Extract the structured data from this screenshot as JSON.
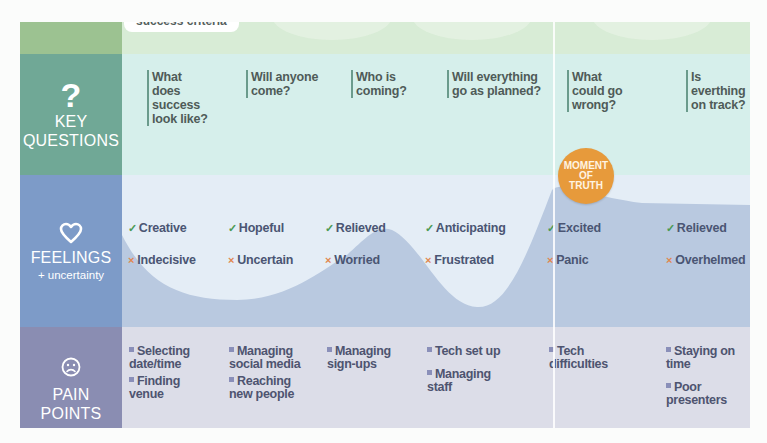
{
  "top_row": {
    "pill_label": "success criteria"
  },
  "key_questions": {
    "icon": "?",
    "label_line1": "KEY",
    "label_line2": "QUESTIONS",
    "questions": [
      "What does success look like?",
      "Will anyone come?",
      "Who is coming?",
      "Will everything go as planned?",
      "What could go wrong?",
      "Is everthing on track?"
    ]
  },
  "moment_of_truth": {
    "line1": "MOMENT",
    "line2": "OF",
    "line3": "TRUTH",
    "color": "#e79a3b"
  },
  "feelings": {
    "icon": "heart-icon",
    "label": "FEELINGS",
    "sublabel": "+ uncertainty",
    "positive_mark": "✓",
    "negative_mark": "×",
    "positive": [
      "Creative",
      "Hopeful",
      "Relieved",
      "Anticipating",
      "Excited",
      "Relieved"
    ],
    "negative": [
      "Indecisive",
      "Uncertain",
      "Worried",
      "Frustrated",
      "Panic",
      "Overhelmed"
    ]
  },
  "pain_points": {
    "icon": "sad-face-icon",
    "label_line1": "PAIN",
    "label_line2": "POINTS",
    "items": [
      [
        "Selecting date/time",
        "Finding venue"
      ],
      [
        "Managing social media",
        "Reaching new people"
      ],
      [
        "Managing sign-ups"
      ],
      [
        "Tech set up",
        "Managing staff"
      ],
      [
        "Tech difficulties"
      ],
      [
        "Staying on time",
        "Poor presenters"
      ]
    ]
  },
  "colors": {
    "questions_label": "#70a896",
    "feelings_label": "#7d9bc8",
    "pain_label": "#8a8db2",
    "positive": "#4c9a55",
    "negative": "#e1874f"
  }
}
